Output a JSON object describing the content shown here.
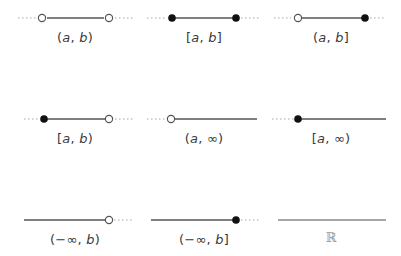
{
  "colors": {
    "line": "#555555",
    "dotted": "#bdbdbd",
    "closed_dot": "#111111",
    "open_dot_stroke": "#555555",
    "open_dot_fill": "#ffffff",
    "label": "#3a3a3a",
    "reals_label": "#9a9a9a"
  },
  "intervals": [
    {
      "id": "open-open",
      "label": "(a, b)",
      "left": "open",
      "right": "open"
    },
    {
      "id": "closed-closed",
      "label": "[a, b]",
      "left": "closed",
      "right": "closed"
    },
    {
      "id": "open-closed",
      "label": "(a, b]",
      "left": "open",
      "right": "closed"
    },
    {
      "id": "closed-open",
      "label": "[a, b)",
      "left": "closed",
      "right": "open"
    },
    {
      "id": "open-infinity",
      "label": "(a, ∞)",
      "left": "open",
      "right": "infinite"
    },
    {
      "id": "closed-infinity",
      "label": "[a, ∞)",
      "left": "closed",
      "right": "infinite"
    },
    {
      "id": "neginf-open",
      "label": "(−∞, b)",
      "left": "infinite",
      "right": "open"
    },
    {
      "id": "neginf-closed",
      "label": "(−∞, b]",
      "left": "infinite",
      "right": "closed"
    },
    {
      "id": "all-reals",
      "label": "ℝ",
      "left": "infinite",
      "right": "infinite"
    }
  ]
}
